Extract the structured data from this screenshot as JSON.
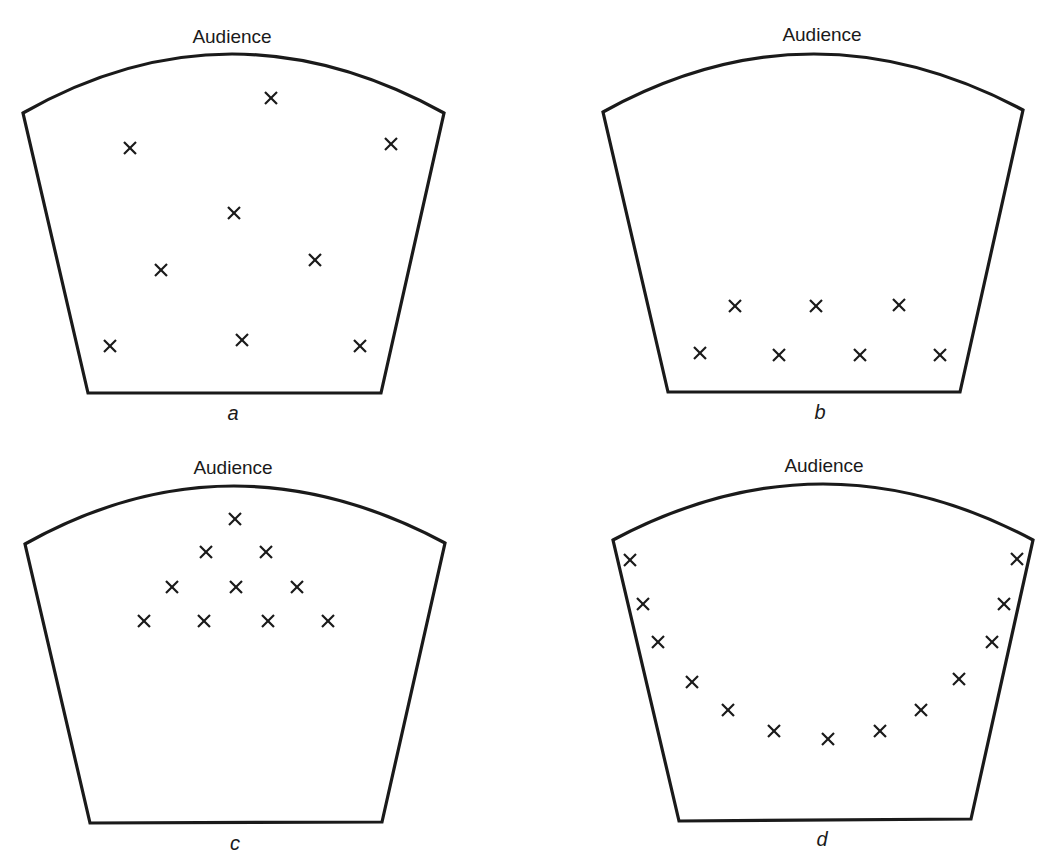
{
  "figure": {
    "panels": [
      {
        "id": "a",
        "caption": "a",
        "audience_label": "Audience",
        "stage": {
          "top_left": [
            23,
            113
          ],
          "top_right": [
            444,
            113
          ],
          "apex": [
            232,
            54
          ],
          "bottom_left": [
            88,
            393
          ],
          "bottom_right": [
            381,
            393
          ]
        },
        "label_pos": [
          232,
          43
        ],
        "caption_pos": [
          233,
          420
        ],
        "performers": [
          [
            271,
            98
          ],
          [
            130,
            148
          ],
          [
            391,
            144
          ],
          [
            234,
            213
          ],
          [
            161,
            270
          ],
          [
            315,
            260
          ],
          [
            110,
            346
          ],
          [
            242,
            340
          ],
          [
            360,
            346
          ]
        ]
      },
      {
        "id": "b",
        "caption": "b",
        "audience_label": "Audience",
        "stage": {
          "top_left": [
            603,
            112
          ],
          "top_right": [
            1023,
            110
          ],
          "apex": [
            812,
            54
          ],
          "bottom_left": [
            668,
            392
          ],
          "bottom_right": [
            960,
            392
          ]
        },
        "label_pos": [
          822,
          41
        ],
        "caption_pos": [
          820,
          419
        ],
        "performers": [
          [
            735,
            306
          ],
          [
            816,
            306
          ],
          [
            899,
            305
          ],
          [
            700,
            353
          ],
          [
            779,
            355
          ],
          [
            860,
            355
          ],
          [
            940,
            355
          ]
        ]
      },
      {
        "id": "c",
        "caption": "c",
        "audience_label": "Audience",
        "stage": {
          "top_left": [
            25,
            544
          ],
          "top_right": [
            445,
            543
          ],
          "apex": [
            233,
            486
          ],
          "bottom_left": [
            90,
            823
          ],
          "bottom_right": [
            382,
            822
          ]
        },
        "label_pos": [
          233,
          474
        ],
        "caption_pos": [
          235,
          850
        ],
        "performers": [
          [
            235,
            519
          ],
          [
            206,
            552
          ],
          [
            266,
            552
          ],
          [
            172,
            587
          ],
          [
            236,
            587
          ],
          [
            297,
            587
          ],
          [
            144,
            621
          ],
          [
            204,
            621
          ],
          [
            268,
            621
          ],
          [
            328,
            621
          ]
        ]
      },
      {
        "id": "d",
        "caption": "d",
        "audience_label": "Audience",
        "stage": {
          "top_left": [
            613,
            540
          ],
          "top_right": [
            1033,
            540
          ],
          "apex": [
            823,
            484
          ],
          "bottom_left": [
            679,
            821
          ],
          "bottom_right": [
            971,
            819
          ]
        },
        "label_pos": [
          824,
          472
        ],
        "caption_pos": [
          822,
          846
        ],
        "performers": [
          [
            630,
            560
          ],
          [
            643,
            604
          ],
          [
            658,
            642
          ],
          [
            692,
            682
          ],
          [
            728,
            710
          ],
          [
            774,
            731
          ],
          [
            828,
            739
          ],
          [
            880,
            731
          ],
          [
            921,
            710
          ],
          [
            959,
            679
          ],
          [
            992,
            642
          ],
          [
            1004,
            604
          ],
          [
            1017,
            559
          ]
        ]
      }
    ],
    "colors": {
      "ink": "#1a1a1a",
      "background": "#ffffff"
    }
  }
}
